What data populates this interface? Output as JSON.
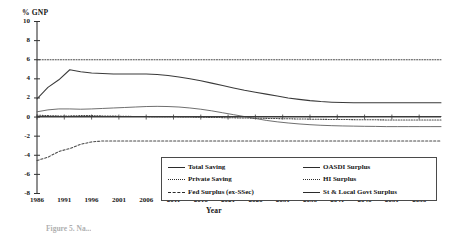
{
  "figure": {
    "caption_fragment": "Figure 5. Na..."
  },
  "axes": {
    "y_title": "% GNP",
    "x_title": "Year",
    "y_ticks": [
      10,
      8,
      6,
      4,
      2,
      0,
      -2,
      -4,
      -6,
      -8
    ],
    "x_ticks": [
      1986,
      1991,
      1996,
      2001,
      2006,
      2011,
      2016,
      2021,
      2026,
      2031,
      2036,
      2041,
      2046,
      2051,
      2056
    ]
  },
  "legend": {
    "left": [
      {
        "label": "Total Saving",
        "style": "solid"
      },
      {
        "label": "Private Saving",
        "style": "dotted"
      },
      {
        "label": "Fed Surplus (ex-SSec)",
        "style": "dashed"
      }
    ],
    "right": [
      {
        "label": "OASDI Surplus",
        "style": "thin"
      },
      {
        "label": "HI Surplus",
        "style": "dotted"
      },
      {
        "label": "St & Local Govt Surplus",
        "style": "solid"
      }
    ]
  },
  "chart_data": {
    "type": "line",
    "title": "",
    "xlabel": "Year",
    "ylabel": "% GNP",
    "xlim": [
      1986,
      2060
    ],
    "ylim": [
      -8,
      10
    ],
    "grid": false,
    "legend_position": "bottom-center",
    "x": [
      1986,
      1988,
      1990,
      1992,
      1994,
      1996,
      1998,
      2000,
      2002,
      2004,
      2006,
      2008,
      2010,
      2012,
      2014,
      2016,
      2018,
      2020,
      2022,
      2024,
      2026,
      2028,
      2030,
      2032,
      2034,
      2036,
      2038,
      2040,
      2042,
      2044,
      2046,
      2048,
      2050,
      2052,
      2054,
      2056,
      2058,
      2060
    ],
    "series": [
      {
        "name": "Total Saving",
        "style": "solid",
        "color": "#3a3a3a",
        "values": [
          1.9,
          3.1,
          3.9,
          4.95,
          4.75,
          4.6,
          4.55,
          4.5,
          4.5,
          4.5,
          4.5,
          4.45,
          4.35,
          4.2,
          4.0,
          3.8,
          3.55,
          3.3,
          3.05,
          2.8,
          2.6,
          2.4,
          2.2,
          2.0,
          1.85,
          1.72,
          1.62,
          1.56,
          1.52,
          1.5,
          1.5,
          1.5,
          1.5,
          1.5,
          1.5,
          1.5,
          1.5,
          1.5
        ]
      },
      {
        "name": "Private Saving",
        "style": "dotted",
        "color": "#4a4a4a",
        "values": [
          6.0,
          6.0,
          6.0,
          6.0,
          6.0,
          6.0,
          6.0,
          6.0,
          6.0,
          6.0,
          6.0,
          6.0,
          6.0,
          6.0,
          6.0,
          6.0,
          6.0,
          6.0,
          6.0,
          6.0,
          6.0,
          6.0,
          6.0,
          6.0,
          6.0,
          6.0,
          6.0,
          6.0,
          6.0,
          6.0,
          6.0,
          6.0,
          6.0,
          6.0,
          6.0,
          6.0,
          6.0,
          6.0
        ]
      },
      {
        "name": "Fed Surplus (ex-SSec)",
        "style": "dashed",
        "color": "#4a4a4a",
        "values": [
          -4.55,
          -4.2,
          -3.6,
          -3.3,
          -2.85,
          -2.6,
          -2.5,
          -2.5,
          -2.5,
          -2.5,
          -2.5,
          -2.5,
          -2.5,
          -2.5,
          -2.5,
          -2.5,
          -2.5,
          -2.5,
          -2.5,
          -2.5,
          -2.5,
          -2.5,
          -2.5,
          -2.5,
          -2.5,
          -2.5,
          -2.5,
          -2.5,
          -2.5,
          -2.5,
          -2.5,
          -2.5,
          -2.5,
          -2.5,
          -2.5,
          -2.5,
          -2.5,
          -2.5
        ]
      },
      {
        "name": "OASDI Surplus",
        "style": "thin",
        "color": "#555555",
        "values": [
          0.55,
          0.75,
          0.85,
          0.85,
          0.82,
          0.85,
          0.9,
          0.95,
          1.0,
          1.05,
          1.1,
          1.12,
          1.1,
          1.05,
          0.95,
          0.82,
          0.65,
          0.45,
          0.25,
          0.05,
          -0.15,
          -0.35,
          -0.5,
          -0.62,
          -0.72,
          -0.8,
          -0.86,
          -0.9,
          -0.93,
          -0.95,
          -0.97,
          -0.98,
          -1.0,
          -1.0,
          -1.0,
          -1.0,
          -1.0,
          -1.0
        ]
      },
      {
        "name": "HI Surplus",
        "style": "dotted",
        "color": "#4a4a4a",
        "values": [
          0.2,
          0.15,
          0.12,
          0.12,
          0.15,
          0.15,
          0.12,
          0.1,
          0.08,
          0.06,
          0.05,
          0.04,
          0.03,
          0.02,
          0.0,
          -0.02,
          -0.04,
          -0.06,
          -0.08,
          -0.1,
          -0.12,
          -0.14,
          -0.16,
          -0.18,
          -0.2,
          -0.22,
          -0.24,
          -0.25,
          -0.26,
          -0.27,
          -0.28,
          -0.29,
          -0.3,
          -0.3,
          -0.3,
          -0.3,
          -0.3,
          -0.3
        ]
      },
      {
        "name": "St & Local Govt Surplus",
        "style": "solid",
        "color": "#3a3a3a",
        "values": [
          0.05,
          0.05,
          0.05,
          0.05,
          0.05,
          0.05,
          0.05,
          0.05,
          0.05,
          0.05,
          0.05,
          0.05,
          0.05,
          0.05,
          0.05,
          0.05,
          0.05,
          0.05,
          0.05,
          0.05,
          0.05,
          0.05,
          0.05,
          0.05,
          0.05,
          0.05,
          0.05,
          0.05,
          0.05,
          0.05,
          0.05,
          0.05,
          0.05,
          0.05,
          0.05,
          0.05,
          0.05,
          0.05
        ]
      }
    ]
  }
}
